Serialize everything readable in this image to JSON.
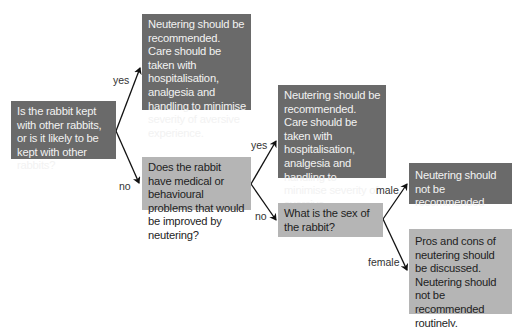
{
  "nodes": {
    "q_kept_with_others": "Is the rabbit kept with other rabbits, or is it likely to be kept with other rabbits?",
    "outcome_yes_1": "Neutering should be recommended. Care should be taken with hospitalisation, analgesia and handling to minimise severity of aversive experience.",
    "q_medical_problems": "Does the rabbit have medical or behavioural problems that would be improved by neutering?",
    "outcome_yes_2": "Neutering should be recommended. Care should be taken with hospitalisation, analgesia and handling to minimise severity of aversive experience.",
    "q_sex": "What is the sex of the rabbit?",
    "outcome_male": "Neutering should not be recommended",
    "outcome_female": "Pros and cons of neutering should be discussed. Neutering should not be recommended routinely."
  },
  "edges": {
    "yes_1": "yes",
    "no_1": "no",
    "yes_2": "yes",
    "no_2": "no",
    "male": "male",
    "female": "female"
  },
  "colors": {
    "dark_box": "#6a6a6a",
    "light_box": "#b5b5b5",
    "arrow": "#111111"
  }
}
